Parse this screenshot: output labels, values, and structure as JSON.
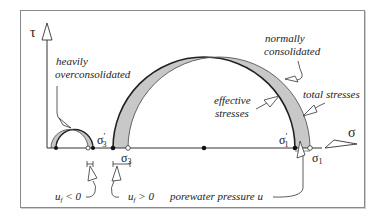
{
  "diagram": {
    "type": "mohr-circle",
    "axes": {
      "y_label": "τ",
      "x_label": "σ"
    },
    "labels": {
      "heavily": "heavily",
      "overconsolidated": "overconsolidated",
      "normally": "normally",
      "consolidated": "consolidated",
      "effective": "effective",
      "stresses_eff": "stresses",
      "total_stresses": "total stresses",
      "sigma3_eff": "σ",
      "sigma3_eff_sub": "3",
      "sigma3_eff_prime": "′",
      "sigma3": "σ",
      "sigma3_sub": "3",
      "sigma1_eff": "σ",
      "sigma1_eff_sub": "1",
      "sigma1_eff_prime": "′",
      "sigma1": "σ",
      "sigma1_sub": "1",
      "uf_neg": "u",
      "uf_neg_sub": "f",
      "uf_neg_rel": " < 0",
      "uf_pos": "u",
      "uf_pos_sub": "f",
      "uf_pos_rel": " > 0",
      "porewater": "porewater pressure u"
    },
    "colors": {
      "shade": "#c8c8c8",
      "line": "#222222",
      "frame": "#8a8a8a"
    }
  }
}
